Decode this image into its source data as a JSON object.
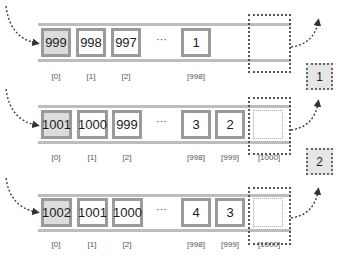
{
  "diagram": {
    "colors": {
      "rail": "#bdbdbd",
      "cell_border": "#9a9a9a",
      "first_cell_fill": "#dcdcdc",
      "badge_fill": "#e6e6e6",
      "arrow": "#333333"
    },
    "rows": [
      {
        "cells": [
          "999",
          "998",
          "997",
          "1"
        ],
        "ellipsis": "···",
        "indices": [
          "[0]",
          "[1]",
          "[2]",
          "[998]"
        ],
        "new_slot_index": ""
      },
      {
        "cells": [
          "1001",
          "1000",
          "999",
          "3",
          "2"
        ],
        "ellipsis": "···",
        "indices": [
          "[0]",
          "[1]",
          "[2]",
          "[998]",
          "[999]"
        ],
        "new_slot_index": "[1000]"
      },
      {
        "cells": [
          "1002",
          "1001",
          "1000",
          "4",
          "3"
        ],
        "ellipsis": "···",
        "indices": [
          "[0]",
          "[1]",
          "[2]",
          "[998]",
          "[999]"
        ],
        "new_slot_index": "[1000]"
      }
    ],
    "badges": [
      "1",
      "2"
    ]
  }
}
